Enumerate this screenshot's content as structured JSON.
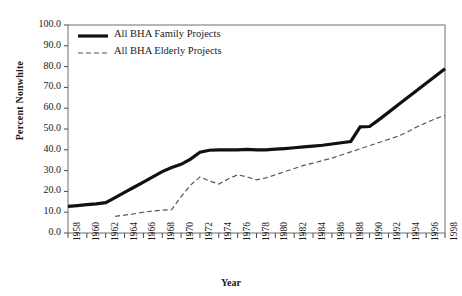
{
  "chart_data": {
    "type": "line",
    "title": "",
    "xlabel": "Year",
    "ylabel": "Percent Nonwhite",
    "xlim": [
      1958,
      1998
    ],
    "ylim": [
      0,
      100
    ],
    "grid": false,
    "legend_position": "top-left",
    "y_ticks": [
      "0.0",
      "10.0",
      "20.0",
      "30.0",
      "40.0",
      "50.0",
      "60.0",
      "70.0",
      "80.0",
      "90.0",
      "100.0"
    ],
    "y_tick_values": [
      0,
      10,
      20,
      30,
      40,
      50,
      60,
      70,
      80,
      90,
      100
    ],
    "x_ticks": [
      "1958",
      "1960",
      "1962",
      "1964",
      "1966",
      "1968",
      "1970",
      "1972",
      "1974",
      "1976",
      "1978",
      "1980",
      "1982",
      "1984",
      "1986",
      "1988",
      "1990",
      "1992",
      "1994",
      "1996",
      "1998"
    ],
    "x_tick_values": [
      1958,
      1960,
      1962,
      1964,
      1966,
      1968,
      1970,
      1972,
      1974,
      1976,
      1978,
      1980,
      1982,
      1984,
      1986,
      1988,
      1990,
      1992,
      1994,
      1996,
      1998
    ],
    "x_minor_every": 1,
    "series": [
      {
        "name": "All BHA Family Projects",
        "style": "solid",
        "color": "#111111",
        "width": 3.2,
        "x": [
          1958,
          1959,
          1960,
          1961,
          1962,
          1963,
          1964,
          1965,
          1966,
          1967,
          1968,
          1969,
          1970,
          1971,
          1972,
          1973,
          1974,
          1975,
          1976,
          1977,
          1978,
          1979,
          1980,
          1981,
          1982,
          1983,
          1984,
          1985,
          1986,
          1987,
          1988,
          1989,
          1990,
          1991,
          1992,
          1993,
          1994,
          1995,
          1996,
          1997,
          1998
        ],
        "y": [
          12.8,
          13.2,
          13.6,
          14.0,
          14.6,
          17.0,
          19.5,
          22.0,
          24.5,
          27.0,
          29.5,
          31.5,
          33.0,
          35.5,
          38.8,
          39.8,
          40.0,
          40.0,
          40.0,
          40.2,
          40.0,
          40.0,
          40.3,
          40.6,
          41.0,
          41.4,
          41.8,
          42.2,
          42.8,
          43.4,
          44.0,
          51.0,
          51.2,
          54.5,
          58.0,
          61.5,
          65.0,
          68.5,
          72.0,
          75.5,
          79.0
        ]
      },
      {
        "name": "All BHA Elderly Projects",
        "style": "dashed",
        "color": "#555555",
        "width": 1.2,
        "x": [
          1963,
          1964,
          1965,
          1966,
          1967,
          1968,
          1969,
          1970,
          1971,
          1972,
          1973,
          1974,
          1975,
          1976,
          1977,
          1978,
          1979,
          1980,
          1981,
          1982,
          1983,
          1984,
          1985,
          1986,
          1987,
          1988,
          1989,
          1990,
          1991,
          1992,
          1993,
          1994,
          1995,
          1996,
          1997,
          1998
        ],
        "y": [
          8.0,
          8.6,
          9.2,
          10.0,
          10.6,
          11.0,
          11.2,
          17.5,
          23.0,
          27.0,
          25.0,
          23.5,
          26.0,
          28.0,
          27.0,
          25.5,
          26.5,
          28.0,
          29.5,
          31.0,
          32.5,
          33.6,
          34.8,
          36.0,
          37.5,
          39.0,
          40.5,
          42.0,
          43.5,
          45.0,
          46.5,
          48.5,
          51.0,
          53.0,
          55.0,
          56.5
        ]
      }
    ]
  },
  "legend": {
    "items": [
      {
        "label": "All BHA Family Projects"
      },
      {
        "label": "All BHA Elderly Projects"
      }
    ]
  },
  "axes": {
    "y_title": "Percent Nonwhite",
    "x_title": "Year"
  }
}
